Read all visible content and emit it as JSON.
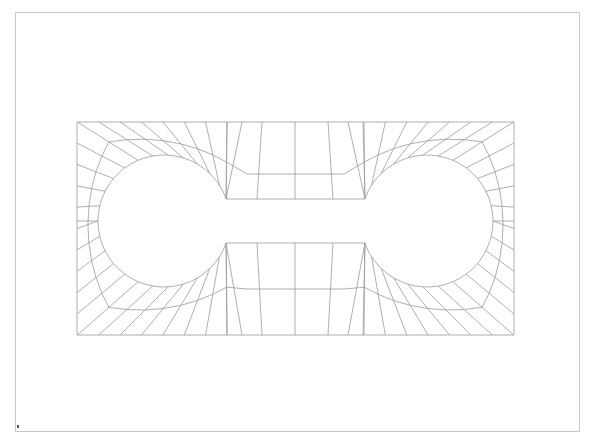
{
  "diagram": {
    "type": "finite-element-mesh",
    "line_color": "#9a9a9a",
    "frame_color": "#c8c8c8",
    "background": "#ffffff"
  },
  "frame": {
    "x": 15,
    "y": 12,
    "width": 564,
    "height": 419
  },
  "plate": {
    "x1": 77,
    "y1": 122,
    "x2": 514,
    "y2": 335
  },
  "holes": [
    {
      "name": "left-circle",
      "cx": 164,
      "cy": 221,
      "r": 66
    },
    {
      "name": "right-circle",
      "cx": 427,
      "cy": 221,
      "r": 66
    }
  ],
  "slot": {
    "x1": 226,
    "x2": 365,
    "y_top": 199,
    "y_bottom": 243
  },
  "mid_band": {
    "x1": 247,
    "x2": 344,
    "y_top": 174,
    "y_bottom": 289
  },
  "center_line_x": 295,
  "mesh": {
    "spokes_per_quarter_circle": 8,
    "center_band_columns": 4,
    "marker": {
      "x": 17,
      "y": 425
    }
  }
}
